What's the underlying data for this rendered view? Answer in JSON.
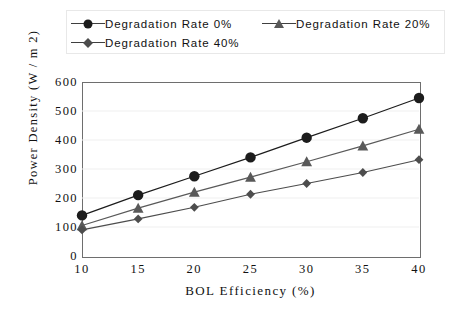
{
  "chart_data": {
    "type": "line",
    "title": "",
    "xlabel": "BOL Efficiency  (%)",
    "ylabel": "Power Density (W / m 2)",
    "x": [
      10,
      15,
      20,
      25,
      30,
      35,
      40
    ],
    "xtick_labels": [
      "10",
      "15",
      "20",
      "25",
      "30",
      "35",
      "40"
    ],
    "ytick_labels": [
      "0",
      "100",
      "200",
      "300",
      "400",
      "500",
      "600"
    ],
    "ytick_values": [
      0,
      100,
      200,
      300,
      400,
      500,
      600
    ],
    "xlim": [
      10,
      40
    ],
    "ylim": [
      0,
      600
    ],
    "grid": true,
    "grid_axis": "y",
    "legend_position": "top",
    "series": [
      {
        "name": "Degradation Rate 0%",
        "marker": "circle",
        "color": "#1c1c1c",
        "values": [
          140,
          210,
          275,
          340,
          408,
          475,
          545
        ]
      },
      {
        "name": "Degradation Rate 20%",
        "marker": "triangle",
        "color": "#595959",
        "values": [
          105,
          165,
          220,
          272,
          325,
          380,
          437
        ]
      },
      {
        "name": "Degradation Rate 40%",
        "marker": "diamond",
        "color": "#4d4d4d",
        "values": [
          90,
          128,
          168,
          213,
          250,
          288,
          332
        ]
      }
    ]
  },
  "legend": {
    "entries": [
      {
        "label": "Degradation Rate  0%",
        "marker": "circle"
      },
      {
        "label": "Degradation Rate  20%",
        "marker": "triangle"
      },
      {
        "label": "Degradation Rate  40%",
        "marker": "diamond"
      }
    ]
  },
  "axes": {
    "y_title": "Power Density (W / m 2)",
    "x_title": "BOL Efficiency  (%)"
  },
  "colors": {
    "series_0": "#1c1c1c",
    "series_1": "#595959",
    "series_2": "#4d4d4d",
    "frame": "#6e6e6e",
    "grid": "#efefef",
    "background": "#ffffff"
  }
}
